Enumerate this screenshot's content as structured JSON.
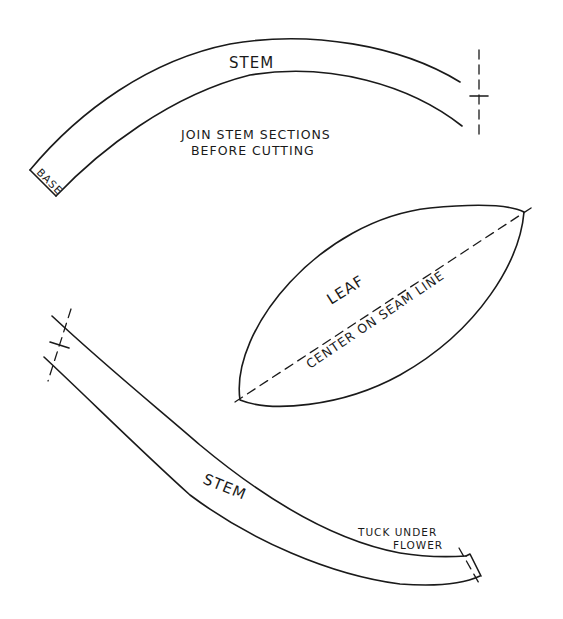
{
  "pieces": {
    "stem_upper": {
      "label": "STEM",
      "base_label": "BASE",
      "note_line1": "JOIN STEM SECTIONS",
      "note_line2": "BEFORE CUTTING",
      "join_mark": "cross-registration-mark"
    },
    "leaf": {
      "label": "LEAF",
      "seam_note": "CENTER ON SEAM LINE"
    },
    "stem_lower": {
      "label": "STEM",
      "note_line1": "TUCK UNDER",
      "note_line2": "FLOWER",
      "join_mark": "cross-registration-mark"
    }
  },
  "colors": {
    "ink": "#1a1a1a",
    "paper": "#ffffff"
  }
}
